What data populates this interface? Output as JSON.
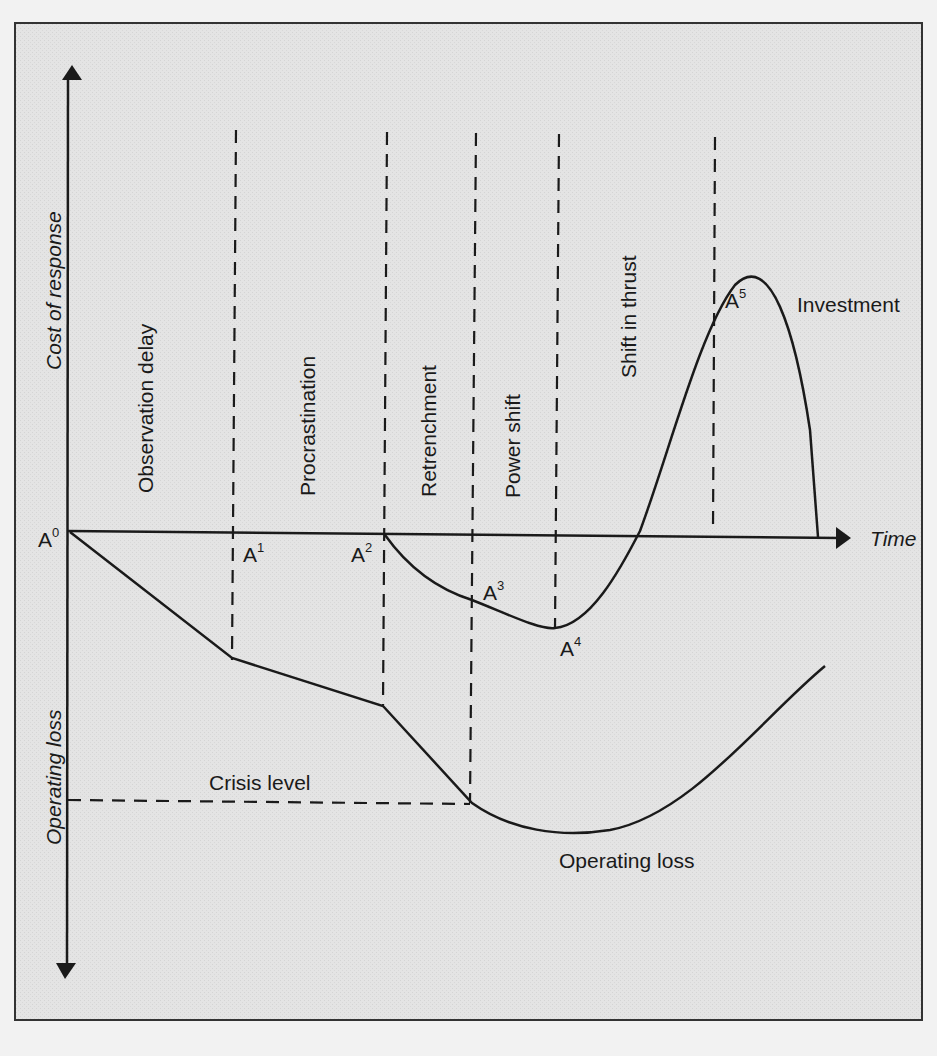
{
  "diagram": {
    "axes": {
      "y_positive_label": "Cost of response",
      "y_negative_label": "Operating loss",
      "x_label": "Time"
    },
    "phases": [
      {
        "label": "Observation delay"
      },
      {
        "label": "Procrastination"
      },
      {
        "label": "Retrenchment"
      },
      {
        "label": "Power shift"
      },
      {
        "label": "Shift in thrust"
      }
    ],
    "points": [
      {
        "base": "A",
        "sup": "0"
      },
      {
        "base": "A",
        "sup": "1"
      },
      {
        "base": "A",
        "sup": "2"
      },
      {
        "base": "A",
        "sup": "3"
      },
      {
        "base": "A",
        "sup": "4"
      },
      {
        "base": "A",
        "sup": "5"
      }
    ],
    "curve_labels": {
      "investment": "Investment",
      "operating_loss": "Operating loss",
      "crisis_level": "Crisis level"
    },
    "colors": {
      "background": "#e6e6e6",
      "ink": "#1a1a1a",
      "frame": "#333333"
    }
  }
}
